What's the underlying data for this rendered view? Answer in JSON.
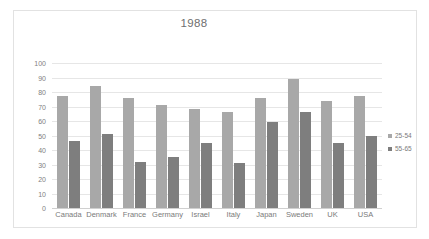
{
  "chart_data": {
    "type": "bar",
    "title": "1988",
    "xlabel": "",
    "ylabel": "",
    "ylim": [
      0,
      100
    ],
    "yticks": [
      0,
      10,
      20,
      30,
      40,
      50,
      60,
      70,
      80,
      90,
      100
    ],
    "grid": true,
    "legend_position": "right",
    "categories": [
      "Canada",
      "Denmark",
      "France",
      "Germany",
      "Israel",
      "Italy",
      "Japan",
      "Sweden",
      "UK",
      "USA"
    ],
    "series": [
      {
        "name": "25-54",
        "color": "#a8a8a8",
        "values": [
          77,
          84,
          76,
          71,
          68,
          66,
          76,
          89,
          74,
          77
        ]
      },
      {
        "name": "55-65",
        "color": "#7e7e7e",
        "values": [
          46,
          51,
          32,
          35,
          45,
          31,
          59,
          66,
          45,
          50
        ]
      }
    ]
  },
  "colors": {
    "series_25_54": "#a8a8a8",
    "series_55_65": "#7e7e7e",
    "gridline": "#e6e6e6",
    "axis_text": "#808080",
    "title_text": "#6f6f6f",
    "frame_border": "#e2e2e2",
    "background": "#ffffff"
  }
}
